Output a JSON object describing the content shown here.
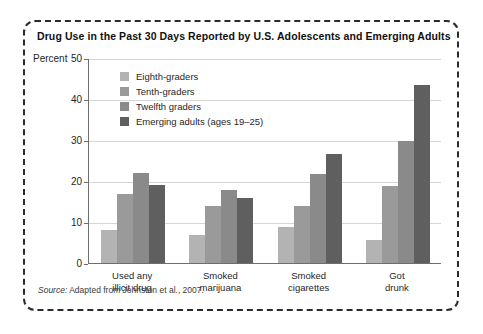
{
  "figure": {
    "title": "Drug Use in the Past 30 Days Reported by U.S. Adolescents and Emerging Adults",
    "source_prefix": "Source:",
    "source_text": "Adapted from Johnston et al., 2007."
  },
  "chart_data": {
    "type": "bar",
    "title": "Drug Use in the Past 30 Days Reported by U.S. Adolescents and Emerging Adults",
    "xlabel": "",
    "ylabel": "Percent",
    "ylim": [
      0,
      50
    ],
    "yticks": [
      0,
      10,
      20,
      30,
      40,
      50
    ],
    "grid": true,
    "legend_position": "upper-left-inside",
    "categories": [
      "Used any illicit drug",
      "Smoked marijuana",
      "Smoked cigarettes",
      "Got drunk"
    ],
    "category_lines": [
      [
        "Used any",
        "illicit drug"
      ],
      [
        "Smoked",
        "marijuana"
      ],
      [
        "Smoked",
        "cigarettes"
      ],
      [
        "Got",
        "drunk"
      ]
    ],
    "series": [
      {
        "name": "Eighth-graders",
        "color": "#b3b3b3",
        "values": [
          8.0,
          6.8,
          8.8,
          5.5
        ]
      },
      {
        "name": "Tenth-graders",
        "color": "#9a9a9a",
        "values": [
          16.8,
          14.0,
          14.0,
          18.9
        ]
      },
      {
        "name": "Twelfth graders",
        "color": "#8a8a8a",
        "values": [
          22.0,
          17.8,
          21.8,
          29.7
        ]
      },
      {
        "name": "Emerging adults (ages 19–25)",
        "color": "#5f5f5f",
        "values": [
          19.1,
          15.8,
          26.6,
          43.5
        ]
      }
    ]
  },
  "colors": {
    "border": "#2b2b2b",
    "gridline": "#d6d6d6",
    "axis": "#6e6e6e",
    "text": "#1f1f1f"
  }
}
